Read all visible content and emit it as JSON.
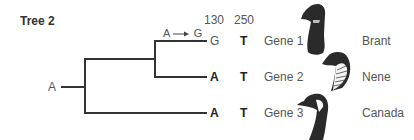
{
  "title": "Tree 2",
  "root_state": "A",
  "mutation_label": "A → G",
  "mutation": {
    "from": "A",
    "to": "G"
  },
  "position_headers": [
    "130",
    "250"
  ],
  "rows": [
    {
      "pos130": "G",
      "pos250": "T",
      "gene": "Gene 1",
      "species": "Brant",
      "icon": "brant-goose-head-icon"
    },
    {
      "pos130": "A",
      "pos250": "T",
      "gene": "Gene 2",
      "species": "Nene",
      "icon": "nene-goose-head-icon"
    },
    {
      "pos130": "A",
      "pos250": "T",
      "gene": "Gene 3",
      "species": "Canada",
      "icon": "canada-goose-head-icon"
    }
  ],
  "colors": {
    "line": "#333333",
    "text": "#555555",
    "bold_text": "#222222",
    "bird_dark": "#2a2a2a"
  }
}
